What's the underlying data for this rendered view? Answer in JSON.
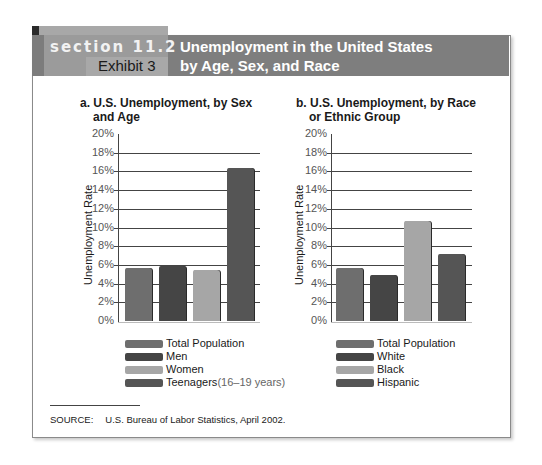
{
  "header": {
    "section": "section 11.2",
    "exhibit": "Exhibit 3",
    "title_line1": "Unemployment in the United States",
    "title_line2": "by Age, Sex, and Race"
  },
  "charts": {
    "a": {
      "title_line1": "a. U.S. Unemployment, by Sex",
      "title_line2": "and Age",
      "ylabel": "Unemployment Rate",
      "legend": [
        {
          "label": "Total Population",
          "note": ""
        },
        {
          "label": "Men",
          "note": ""
        },
        {
          "label": "Women",
          "note": ""
        },
        {
          "label": "Teenagers",
          "note": " (16–19 years)"
        }
      ]
    },
    "b": {
      "title_line1": "b. U.S. Unemployment, by Race",
      "title_line2": "or Ethnic Group",
      "ylabel": "Unemployment Rate",
      "legend": [
        {
          "label": "Total Population",
          "note": ""
        },
        {
          "label": "White",
          "note": ""
        },
        {
          "label": "Black",
          "note": ""
        },
        {
          "label": "Hispanic",
          "note": ""
        }
      ]
    }
  },
  "ticks": [
    "20%",
    "18%",
    "16%",
    "14%",
    "12%",
    "10%",
    "8%",
    "6%",
    "4%",
    "2%",
    "0%"
  ],
  "source": {
    "label": "SOURCE:",
    "text": "U.S. Bureau of Labor Statistics, April 2002."
  },
  "colors": {
    "total": "#6e6e6e",
    "men_white": "#454545",
    "women_black": "#a6a6a6",
    "teen_hispanic": "#555555",
    "header_dark": "#7e7e7e",
    "header_light": "#9b9b9b"
  },
  "chart_data": [
    {
      "type": "bar",
      "title": "a. U.S. Unemployment, by Sex and Age",
      "categories": [
        "Total Population",
        "Men",
        "Women",
        "Teenagers (16–19 years)"
      ],
      "values": [
        5.7,
        5.9,
        5.5,
        16.4
      ],
      "xlabel": "",
      "ylabel": "Unemployment Rate",
      "ylim": [
        0,
        20
      ],
      "yticks": [
        0,
        2,
        4,
        6,
        8,
        10,
        12,
        14,
        16,
        18,
        20
      ],
      "grid": true,
      "legend_position": "bottom"
    },
    {
      "type": "bar",
      "title": "b. U.S. Unemployment, by Race or Ethnic Group",
      "categories": [
        "Total Population",
        "White",
        "Black",
        "Hispanic"
      ],
      "values": [
        5.7,
        4.9,
        10.7,
        7.2
      ],
      "xlabel": "",
      "ylabel": "Unemployment Rate",
      "ylim": [
        0,
        20
      ],
      "yticks": [
        0,
        2,
        4,
        6,
        8,
        10,
        12,
        14,
        16,
        18,
        20
      ],
      "grid": true,
      "legend_position": "bottom"
    }
  ]
}
